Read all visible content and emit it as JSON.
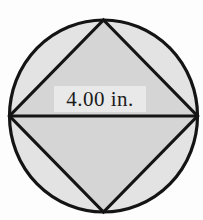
{
  "figure": {
    "dimension_label": "4.00 in.",
    "colors": {
      "background": "#fdfdfd",
      "circle_fill": "#e3e3e3",
      "square_fill": "#d5d5d5",
      "label_bg": "#e9e9e9",
      "outline": "#141414",
      "label_color": "#1c1c1c"
    }
  }
}
